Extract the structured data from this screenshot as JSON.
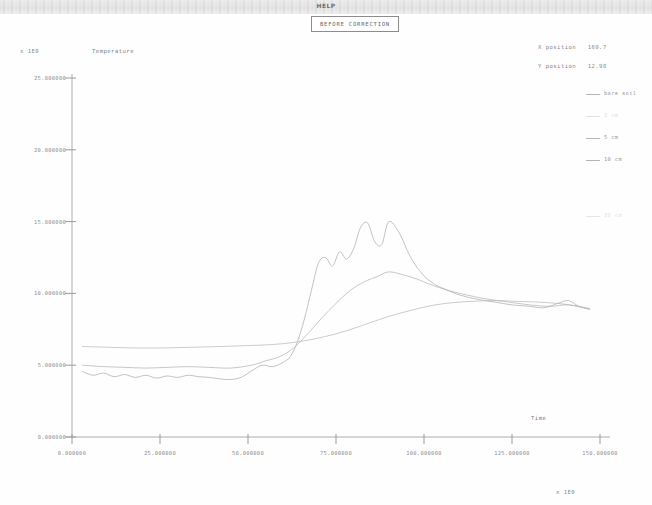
{
  "window": {
    "caption": "HELP"
  },
  "chart_title": "BEFORE CORRECTION",
  "readouts": {
    "x_position_label": "X position",
    "x_position_value": "169.7",
    "y_position_label": "Y position",
    "y_position_value": "12.98"
  },
  "axis_exponents": {
    "y": "x 1E0",
    "x": "x 1E0"
  },
  "legend": {
    "items": [
      {
        "label": "bare soil",
        "color": "#b4b4b4",
        "faint": false
      },
      {
        "label": "2 cm",
        "color": "#e2e2e2",
        "faint": true
      },
      {
        "label": "5 cm",
        "color": "#b4b4b4",
        "faint": false
      },
      {
        "label": "10 cm",
        "color": "#b4b4b4",
        "faint": false
      }
    ],
    "extra": {
      "label": "20 cm",
      "color": "#e6e6e6"
    }
  },
  "chart_data": {
    "type": "line",
    "title": "BEFORE CORRECTION",
    "xlabel": "Time",
    "ylabel": "Temperature",
    "xlim": [
      0,
      150
    ],
    "ylim": [
      0,
      25
    ],
    "grid": false,
    "legend_position": "right",
    "xticks": [
      "0.000000",
      "25.000000",
      "50.000000",
      "75.000000",
      "100.000000",
      "125.000000",
      "150.000000"
    ],
    "xtick_values": [
      0,
      25,
      50,
      75,
      100,
      125,
      150
    ],
    "yticks": [
      "0.000000",
      "5.000000",
      "10.000000",
      "15.000000",
      "20.000000",
      "25.000000"
    ],
    "ytick_values": [
      0,
      5,
      10,
      15,
      20,
      25
    ],
    "series": [
      {
        "name": "bare soil",
        "color": "#a9a9a9",
        "x": [
          3,
          6,
          9,
          12,
          15,
          18,
          21,
          24,
          27,
          30,
          33,
          36,
          39,
          42,
          45,
          48,
          51,
          54,
          57,
          60,
          62,
          64,
          66,
          68,
          70,
          72,
          74,
          76,
          78,
          80,
          82,
          84,
          86,
          88,
          90,
          93,
          96,
          99,
          102,
          105,
          110,
          115,
          120,
          125,
          130,
          134,
          138,
          141,
          144,
          147
        ],
        "values": [
          4.55,
          4.3,
          4.45,
          4.2,
          4.35,
          4.15,
          4.3,
          4.1,
          4.25,
          4.15,
          4.3,
          4.2,
          4.15,
          4.05,
          4.0,
          4.15,
          4.6,
          5.0,
          4.9,
          5.2,
          5.6,
          6.6,
          8.2,
          10.2,
          12.1,
          12.5,
          11.9,
          12.9,
          12.4,
          13.1,
          14.6,
          14.9,
          13.6,
          13.4,
          15.0,
          14.2,
          12.6,
          11.5,
          10.8,
          10.4,
          9.9,
          9.6,
          9.4,
          9.2,
          9.1,
          9.0,
          9.3,
          9.5,
          9.1,
          8.9
        ]
      },
      {
        "name": "5 cm",
        "color": "#b0b0b0",
        "x": [
          3,
          9,
          15,
          21,
          27,
          33,
          39,
          45,
          51,
          55,
          59,
          63,
          67,
          71,
          75,
          79,
          83,
          87,
          90,
          94,
          98,
          102,
          107,
          112,
          118,
          124,
          130,
          136,
          141,
          147
        ],
        "values": [
          5.0,
          4.9,
          4.85,
          4.8,
          4.85,
          4.9,
          4.85,
          4.8,
          5.0,
          5.3,
          5.6,
          6.2,
          7.2,
          8.3,
          9.3,
          10.2,
          10.8,
          11.2,
          11.5,
          11.3,
          11.0,
          10.6,
          10.2,
          9.9,
          9.6,
          9.4,
          9.2,
          9.1,
          9.2,
          8.9
        ]
      },
      {
        "name": "10 cm",
        "color": "#b6b6b6",
        "x": [
          3,
          10,
          18,
          26,
          34,
          42,
          48,
          54,
          60,
          66,
          72,
          78,
          84,
          90,
          96,
          102,
          108,
          114,
          120,
          126,
          132,
          138,
          144,
          147
        ],
        "values": [
          6.3,
          6.25,
          6.2,
          6.2,
          6.25,
          6.3,
          6.35,
          6.4,
          6.5,
          6.7,
          7.0,
          7.4,
          7.9,
          8.4,
          8.8,
          9.15,
          9.35,
          9.45,
          9.5,
          9.45,
          9.4,
          9.3,
          9.1,
          8.95
        ]
      }
    ]
  }
}
